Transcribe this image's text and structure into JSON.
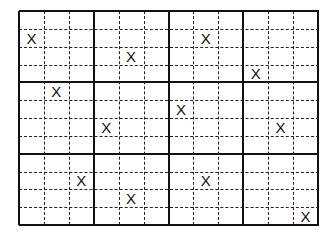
{
  "puzzle": {
    "type": "grid-placement",
    "block_rows": 3,
    "block_cols": 4,
    "rows_per_block": 4,
    "cols_per_block": 3,
    "total_rows": 12,
    "total_cols": 12,
    "mark_symbol": "X",
    "line_color": "#111111",
    "marks": [
      {
        "row": 1,
        "col": 0,
        "label": "X"
      },
      {
        "row": 2,
        "col": 4,
        "label": "X"
      },
      {
        "row": 1,
        "col": 7,
        "label": "X"
      },
      {
        "row": 3,
        "col": 9,
        "label": "X"
      },
      {
        "row": 4,
        "col": 1,
        "label": "X"
      },
      {
        "row": 6,
        "col": 3,
        "label": "X"
      },
      {
        "row": 5,
        "col": 6,
        "label": "X"
      },
      {
        "row": 6,
        "col": 10,
        "label": "X"
      },
      {
        "row": 9,
        "col": 2,
        "label": "X"
      },
      {
        "row": 10,
        "col": 4,
        "label": "X"
      },
      {
        "row": 9,
        "col": 7,
        "label": "X"
      },
      {
        "row": 11,
        "col": 11,
        "label": "X"
      }
    ]
  }
}
